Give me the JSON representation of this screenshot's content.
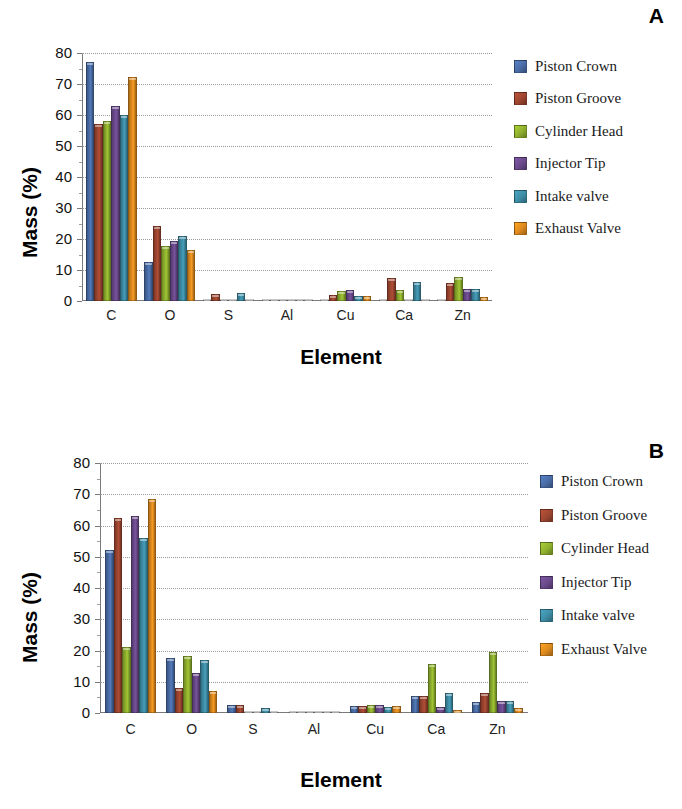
{
  "figure": {
    "panels": [
      {
        "letter": "A",
        "axis": {
          "ylabel": "Mass (%)",
          "xlabel": "Element"
        }
      },
      {
        "letter": "B",
        "axis": {
          "ylabel": "Mass (%)",
          "xlabel": "Element"
        }
      }
    ],
    "legend_labels": [
      "Piston Crown",
      "Piston Groove",
      "Cylinder Head",
      "Injector Tip",
      "Intake valve",
      "Exhaust Valve"
    ],
    "series_colors": [
      "#4A6DA7",
      "#9E4630",
      "#8FB02E",
      "#6B4A8C",
      "#3E8DA6",
      "#DD8A1E"
    ],
    "ytick_labels": [
      "0",
      "10",
      "20",
      "30",
      "40",
      "50",
      "60",
      "70",
      "80"
    ]
  },
  "chart_data": [
    {
      "type": "bar",
      "title": "A",
      "xlabel": "Element",
      "ylabel": "Mass (%)",
      "ylim": [
        0,
        80
      ],
      "yticks": [
        0,
        10,
        20,
        30,
        40,
        50,
        60,
        70,
        80
      ],
      "grid": true,
      "legend_position": "right",
      "categories": [
        "C",
        "O",
        "S",
        "Al",
        "Cu",
        "Ca",
        "Zn"
      ],
      "series": [
        {
          "name": "Piston Crown",
          "values": [
            77.2,
            12.7,
            0.0,
            0.2,
            0.7,
            0.3,
            0.4
          ]
        },
        {
          "name": "Piston Groove",
          "values": [
            57.0,
            24.3,
            2.3,
            0.3,
            1.9,
            7.4,
            5.9
          ]
        },
        {
          "name": "Cylinder Head",
          "values": [
            58.0,
            17.8,
            0.6,
            0.2,
            3.3,
            3.4,
            7.6
          ]
        },
        {
          "name": "Injector Tip",
          "values": [
            62.8,
            19.2,
            0.0,
            0.2,
            3.4,
            0.6,
            3.9
          ]
        },
        {
          "name": "Intake valve",
          "values": [
            59.9,
            21.0,
            2.5,
            0.3,
            1.6,
            6.0,
            4.0
          ]
        },
        {
          "name": "Exhaust Valve",
          "values": [
            72.3,
            16.3,
            0.0,
            0.2,
            1.7,
            0.5,
            1.4
          ]
        }
      ]
    },
    {
      "type": "bar",
      "title": "B",
      "xlabel": "Element",
      "ylabel": "Mass (%)",
      "ylim": [
        0,
        80
      ],
      "yticks": [
        0,
        10,
        20,
        30,
        40,
        50,
        60,
        70,
        80
      ],
      "grid": true,
      "legend_position": "right",
      "categories": [
        "C",
        "O",
        "S",
        "Al",
        "Cu",
        "Ca",
        "Zn"
      ],
      "series": [
        {
          "name": "Piston Crown",
          "values": [
            52.2,
            17.5,
            2.6,
            0.0,
            2.2,
            5.5,
            3.5
          ]
        },
        {
          "name": "Piston Groove",
          "values": [
            62.4,
            8.1,
            2.6,
            0.0,
            2.1,
            5.4,
            6.4
          ]
        },
        {
          "name": "Cylinder Head",
          "values": [
            21.1,
            18.1,
            0.0,
            0.5,
            2.7,
            15.8,
            19.4
          ]
        },
        {
          "name": "Injector Tip",
          "values": [
            62.9,
            12.9,
            0.0,
            0.0,
            2.6,
            2.0,
            3.9
          ]
        },
        {
          "name": "Intake valve",
          "values": [
            56.0,
            16.9,
            1.7,
            0.0,
            1.9,
            6.5,
            3.9
          ]
        },
        {
          "name": "Exhaust Valve",
          "values": [
            68.5,
            6.9,
            0.0,
            0.0,
            2.1,
            1.1,
            1.5
          ]
        }
      ]
    }
  ]
}
